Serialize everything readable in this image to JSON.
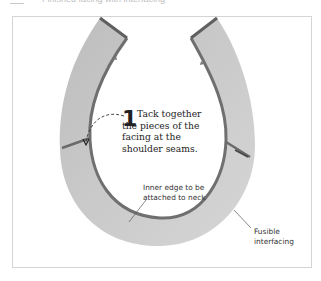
{
  "header": {
    "partial_text": "Finished facing with interfacing"
  },
  "figure": {
    "step": {
      "number": "1",
      "text": "Tack together the pieces of the facing at the shoulder seams."
    },
    "labels": {
      "inner_edge": "Inner edge to be attached to neck",
      "fusible": "Fusible interfacing"
    },
    "colors": {
      "facing_fill": "#c4c4c4",
      "edge_stroke": "#6f6f6f",
      "frame_border": "#d4d4d4",
      "text": "#222222"
    }
  }
}
